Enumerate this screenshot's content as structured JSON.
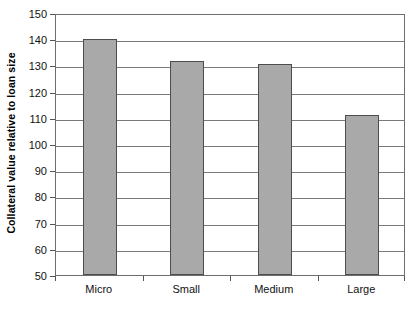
{
  "chart_data": {
    "type": "bar",
    "title": "",
    "subtitle": "",
    "xlabel": "",
    "ylabel": "Collateral value relative to loan size",
    "categories": [
      "Micro",
      "Small",
      "Medium",
      "Large"
    ],
    "values": [
      140,
      131.5,
      130.5,
      111
    ],
    "series": [
      {
        "name": "Collateral value relative to loan size",
        "values": [
          140,
          131.5,
          130.5,
          111
        ]
      }
    ],
    "ylim": [
      50,
      150
    ],
    "ytick_labels": [
      "150",
      "140",
      "130",
      "120",
      "110",
      "100",
      "90",
      "80",
      "70",
      "60",
      "50"
    ],
    "ytick_values": [
      150,
      140,
      130,
      120,
      110,
      100,
      90,
      80,
      70,
      60,
      50
    ],
    "grid": "horizontal",
    "legend": "none",
    "bar_color": "#a9a9a9",
    "bar_border_color": "#4d4d4d",
    "axis_color": "#6e6e6e",
    "gridline_color": "#7a7a7a",
    "background_color": "#ffffff"
  }
}
